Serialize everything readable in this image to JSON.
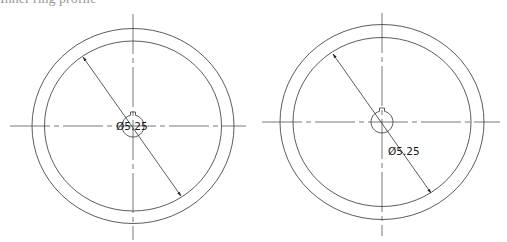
{
  "header": {
    "partial_text": "Inner ring profile"
  },
  "drawings": [
    {
      "name": "left-view",
      "center": [
        133,
        126
      ],
      "outer": {
        "rx": 101,
        "ry": 97.5
      },
      "inner": {
        "rx": 88.5,
        "ry": 85
      },
      "hub": {
        "r": 11
      },
      "dimension": {
        "label": "Ø5.25",
        "from": [
          83,
          57
        ],
        "to": [
          181,
          196
        ],
        "label_pos": [
          115,
          120
        ]
      }
    },
    {
      "name": "right-view",
      "center": [
        382,
        122
      ],
      "outer": {
        "rx": 102,
        "ry": 97.5
      },
      "inner": {
        "rx": 89,
        "ry": 84.5
      },
      "hub": {
        "r": 11
      },
      "dimension": {
        "label": "Ø5.25",
        "from": [
          333,
          54
        ],
        "to": [
          431,
          193
        ],
        "label_pos": [
          388,
          146
        ]
      }
    }
  ],
  "style": {
    "line_color": "#4a4a4a",
    "center_line_color": "#555555",
    "background": "#ffffff"
  }
}
